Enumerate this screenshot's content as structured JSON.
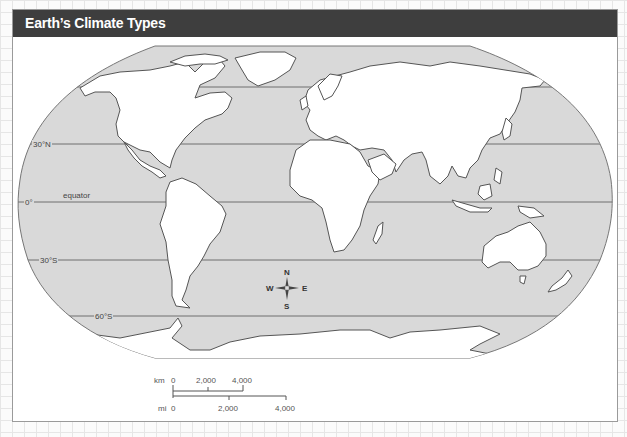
{
  "header": {
    "title": "Earth’s Climate Types"
  },
  "map": {
    "projection": "Robinson-style world outline",
    "ocean_color": "#d9d9d9",
    "land_color": "#ffffff",
    "outline_color": "#555555",
    "latitude_lines": [
      {
        "label": "",
        "name": "60N"
      },
      {
        "label": "30°N",
        "name": "30N"
      },
      {
        "label": "0°",
        "name": "equator"
      },
      {
        "label": "30°S",
        "name": "30S"
      },
      {
        "label": "60°S",
        "name": "60S"
      }
    ],
    "equator_label": "equator"
  },
  "compass": {
    "n": "N",
    "s": "S",
    "e": "E",
    "w": "W"
  },
  "scale_bar": {
    "km_unit": "km",
    "km_ticks": [
      "0",
      "2,000",
      "4,000"
    ],
    "mi_unit": "mi",
    "mi_ticks": [
      "0",
      "2,000",
      "4,000"
    ]
  }
}
